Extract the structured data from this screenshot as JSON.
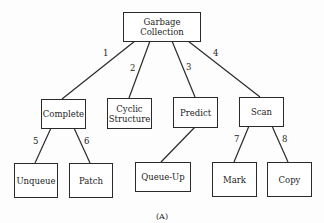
{
  "root": {
    "label": "Garbage Collection"
  },
  "children": [
    {
      "edge": "1",
      "label": "Complete",
      "children": [
        {
          "edge": "5",
          "label": "Unqueue"
        },
        {
          "edge": "6",
          "label": "Patch"
        }
      ]
    },
    {
      "edge": "2",
      "label": "Cyclic Structure",
      "children": []
    },
    {
      "edge": "3",
      "label": "Predict",
      "children": [
        {
          "edge": "",
          "label": "Queue-Up"
        }
      ]
    },
    {
      "edge": "4",
      "label": "Scan",
      "children": [
        {
          "edge": "7",
          "label": "Mark"
        },
        {
          "edge": "8",
          "label": "Copy"
        }
      ]
    }
  ],
  "caption": "(A)"
}
